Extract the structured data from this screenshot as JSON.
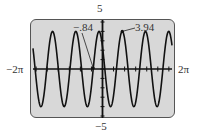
{
  "chart_data": {
    "type": "line",
    "title": "",
    "xlabel": "",
    "ylabel": "",
    "xlim_label": [
      "-2π",
      "2π"
    ],
    "xlim": [
      -6.2832,
      6.2832
    ],
    "ylim_label": [
      "-5",
      "5"
    ],
    "ylim": [
      -5,
      5
    ],
    "grid": false,
    "x_tick_spacing": 1,
    "y_tick_spacing": 1,
    "series": [
      {
        "name": "f(x)",
        "description": "sinusoid, amplitude ≈ 4, about 6 periods across [-2π, 2π]",
        "amplitude": 4,
        "approx_period": 2.1,
        "color": "#111111"
      }
    ],
    "annotations": [
      {
        "text": "-.84",
        "x": -0.84,
        "y": 0,
        "note": "zero crossing"
      },
      {
        "text": "3.94",
        "x": 1.45,
        "y": 3.94,
        "note": "local maximum"
      }
    ]
  },
  "labels": {
    "y_max": "5",
    "y_min": "−5",
    "x_min": "−2π",
    "x_max": "2π",
    "zero_annot": "−.84",
    "max_annot": "3.94"
  },
  "colors": {
    "screen_bg": "#d8d8d8",
    "frame": "#555555",
    "curve": "#111111",
    "text": "#333333"
  }
}
